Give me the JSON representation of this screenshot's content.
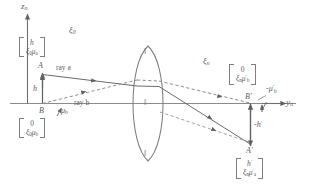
{
  "figure": {
    "type": "optical-ray-diagram",
    "background": "#ffffff",
    "stroke_color": "#6e6f73",
    "text_color": "#5c5d61"
  },
  "axes": {
    "vertical_axis_label": "z",
    "vertical_axis_sub": "n",
    "horizontal_axis_label": "y",
    "horizontal_axis_sub": "n"
  },
  "media": {
    "object_space_label": "ξ",
    "object_space_sub": "0",
    "image_space_label": "ξ",
    "image_space_sub": "n"
  },
  "points": {
    "object_top": "A",
    "object_bottom": "B",
    "image_top": "A′",
    "image_bottom": "B′"
  },
  "rays": {
    "ray_a_label": "ray a",
    "ray_b_label": "ray b"
  },
  "heights": {
    "object_height": "h",
    "image_height": "-h",
    "image_height_sup": "′"
  },
  "angles": {
    "object_angle_b": "μ",
    "object_angle_b_sub": "b",
    "image_angle_b": "-μ",
    "image_angle_b_sub": "b",
    "image_angle_b_sup": "′"
  },
  "matrices": {
    "object_ray_a": {
      "name": "object-ray-a-vector",
      "top": "h",
      "bottom_base": "ξ",
      "bottom_sub1": "0",
      "bottom_mu": "μ",
      "bottom_sub2": "a"
    },
    "object_ray_b": {
      "name": "object-ray-b-vector",
      "top": "0",
      "bottom_base": "ξ",
      "bottom_sub1": "0",
      "bottom_mu": "μ",
      "bottom_sub2": "b"
    },
    "image_ray_b": {
      "name": "image-ray-b-vector",
      "top": "0",
      "bottom_base": "ξ",
      "bottom_sub1": "n",
      "bottom_mu": "μ",
      "bottom_sub2": "b",
      "bottom_prime": "′"
    },
    "image_ray_a": {
      "name": "image-ray-a-vector",
      "top": "h",
      "top_prime": "′",
      "bottom_base": "ξ",
      "bottom_sub1": "n",
      "bottom_mu": "μ",
      "bottom_sub2": "a",
      "bottom_prime": "′"
    }
  },
  "lens": {
    "name": "biconvex-lens",
    "tick_marks": 3,
    "tick_glyph": "‖"
  }
}
